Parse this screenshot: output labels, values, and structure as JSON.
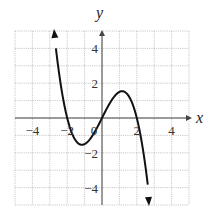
{
  "chart_data": {
    "type": "line",
    "title": "",
    "xlabel": "x",
    "ylabel": "y",
    "xlim": [
      -5,
      5
    ],
    "ylim": [
      -5,
      5
    ],
    "grid": true,
    "grid_step": 1,
    "x_ticks": [
      -4,
      -2,
      0,
      2,
      4
    ],
    "y_ticks": [
      -4,
      -2,
      2,
      4
    ],
    "x_tick_labels": [
      "−4",
      "−2",
      "0",
      "2",
      "4"
    ],
    "y_tick_labels": [
      "−4",
      "−2",
      "2",
      "4"
    ],
    "series": [
      {
        "name": "f(x)",
        "function": "y = -0.5x^3 + 2x",
        "x_range": [
          -2.8,
          2.75
        ],
        "arrows": "both ends",
        "key_points": [
          {
            "x": -2.8,
            "y": 5.0,
            "note": "arrow up"
          },
          {
            "x": -2,
            "y": 0,
            "note": "zero"
          },
          {
            "x": -1.15,
            "y": -1.54,
            "note": "local min"
          },
          {
            "x": 0,
            "y": 0,
            "note": "zero"
          },
          {
            "x": 1.15,
            "y": 1.54,
            "note": "local max"
          },
          {
            "x": 2,
            "y": 0,
            "note": "zero"
          },
          {
            "x": 2.75,
            "y": -5.0,
            "note": "arrow down"
          }
        ]
      }
    ],
    "legend": null
  },
  "labels": {
    "x_axis": "x",
    "y_axis": "y",
    "origin": "0"
  },
  "colors": {
    "curve": "#111111",
    "axes": "#444444",
    "grid": "#bbbbbb",
    "background": "#ffffff"
  }
}
